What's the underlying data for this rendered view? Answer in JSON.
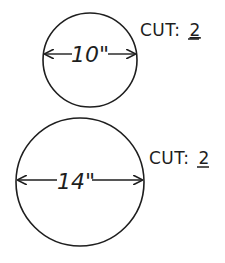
{
  "diagram": {
    "colors": {
      "stroke": "#1e1e1e",
      "background": "#ffffff"
    },
    "circles": [
      {
        "id": "small",
        "diameter_label": "10\"",
        "cut_prefix": "CUT:",
        "cut_count": "2",
        "cx": 90,
        "cy": 60,
        "r": 47
      },
      {
        "id": "large",
        "diameter_label": "14\"",
        "cut_prefix": "CUT:",
        "cut_count": "2",
        "cx": 80,
        "cy": 182,
        "r": 64
      }
    ]
  }
}
